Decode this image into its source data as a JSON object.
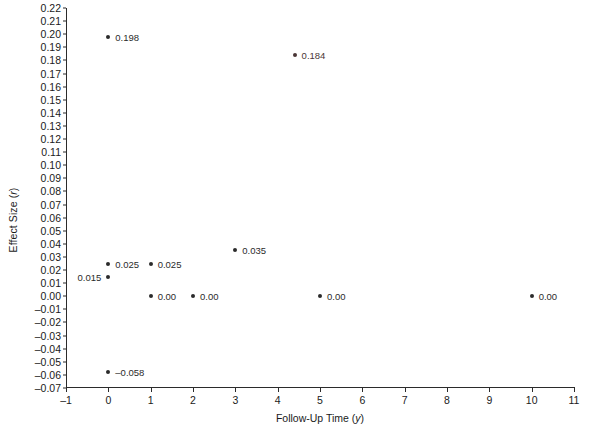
{
  "chart_data": {
    "type": "scatter",
    "title": "",
    "xlabel": "Follow-Up Time (y)",
    "xlabel_plain": "Follow-Up Time",
    "xlabel_italic": "y",
    "ylabel": "Effect Size (r)",
    "ylabel_plain": "Effect Size",
    "ylabel_italic": "r",
    "xlim": [
      -1,
      11
    ],
    "ylim": [
      -0.07,
      0.22
    ],
    "grid": false,
    "legend": "none",
    "xticks": [
      "-1",
      "0",
      "1",
      "2",
      "3",
      "4",
      "5",
      "6",
      "7",
      "8",
      "9",
      "10",
      "11"
    ],
    "xtick_values": [
      -1,
      0,
      1,
      2,
      3,
      4,
      5,
      6,
      7,
      8,
      9,
      10,
      11
    ],
    "yticks": [
      "0.22",
      "0.21",
      "0.20",
      "0.19",
      "0.18",
      "0.17",
      "0.16",
      "0.15",
      "0.14",
      "0.13",
      "0.12",
      "0.11",
      "0.10",
      "0.09",
      "0.08",
      "0.07",
      "0.06",
      "0.05",
      "0.04",
      "0.03",
      "0.02",
      "0.01",
      "0.00",
      "–0.01",
      "–0.02",
      "–0.03",
      "–0.04",
      "–0.05",
      "–0.06",
      "–0.07"
    ],
    "ytick_values": [
      0.22,
      0.21,
      0.2,
      0.19,
      0.18,
      0.17,
      0.16,
      0.15,
      0.14,
      0.13,
      0.12,
      0.11,
      0.1,
      0.09,
      0.08,
      0.07,
      0.06,
      0.05,
      0.04,
      0.03,
      0.02,
      0.01,
      0.0,
      -0.01,
      -0.02,
      -0.03,
      -0.04,
      -0.05,
      -0.06,
      -0.07
    ],
    "marker_color": "#2b2b2b",
    "points": [
      {
        "x": 0,
        "y": 0.198,
        "label": "0.198",
        "label_side": "right",
        "color": "#2b2b2b"
      },
      {
        "x": 4.4,
        "y": 0.184,
        "label": "0.184",
        "label_side": "right",
        "color": "#4a3636"
      },
      {
        "x": 3,
        "y": 0.035,
        "label": "0.035",
        "label_side": "right",
        "color": "#2b2b2b"
      },
      {
        "x": 0,
        "y": 0.025,
        "label": "0.025",
        "label_side": "right",
        "color": "#2b2b2b"
      },
      {
        "x": 1,
        "y": 0.025,
        "label": "0.025",
        "label_side": "right",
        "color": "#2b2b2b"
      },
      {
        "x": 0,
        "y": 0.015,
        "label": "0.015",
        "label_side": "left",
        "color": "#2b2b2b"
      },
      {
        "x": 1,
        "y": 0.0,
        "label": "0.00",
        "label_side": "right",
        "color": "#2b2b2b"
      },
      {
        "x": 2,
        "y": 0.0,
        "label": "0.00",
        "label_side": "right",
        "color": "#2b2b2b"
      },
      {
        "x": 5,
        "y": 0.0,
        "label": "0.00",
        "label_side": "right",
        "color": "#2b2b2b"
      },
      {
        "x": 10,
        "y": 0.0,
        "label": "0.00",
        "label_side": "right",
        "color": "#2b2b2b"
      },
      {
        "x": 0,
        "y": -0.058,
        "label": "–0.058",
        "label_side": "right",
        "color": "#2b2b2b"
      }
    ]
  }
}
